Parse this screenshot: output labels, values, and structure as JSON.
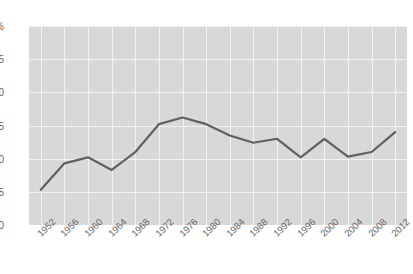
{
  "chart": {
    "title": ""
  },
  "axis": {
    "y_ticks": [
      "30%",
      "25",
      "20",
      "15",
      "10",
      "5",
      "0"
    ],
    "y_tick_values": [
      30,
      25,
      20,
      15,
      10,
      5,
      0
    ]
  },
  "chart_data": {
    "type": "line",
    "title": "",
    "xlabel": "",
    "ylabel": "",
    "ylim": [
      0,
      30
    ],
    "grid": true,
    "legend": "none",
    "y_tick_labels": [
      "0",
      "5",
      "10",
      "15",
      "20",
      "25",
      "30%"
    ],
    "y_ticks": [
      0,
      5,
      10,
      15,
      20,
      25,
      30
    ],
    "categories": [
      "1952",
      "1956",
      "1960",
      "1964",
      "1968",
      "1972",
      "1976",
      "1980",
      "1984",
      "1988",
      "1992",
      "1996",
      "2000",
      "2004",
      "2008",
      "2012"
    ],
    "values": [
      5.3,
      9.3,
      10.2,
      8.3,
      11.0,
      15.2,
      16.2,
      15.2,
      13.5,
      12.4,
      13.0,
      10.2,
      13.0,
      10.3,
      11.0,
      14.0
    ],
    "series": [
      {
        "name": "series-1",
        "color": "#606060",
        "values": [
          5.3,
          9.3,
          10.2,
          8.3,
          11.0,
          15.2,
          16.2,
          15.2,
          13.5,
          12.4,
          13.0,
          10.2,
          13.0,
          10.3,
          11.0,
          14.0
        ]
      }
    ]
  },
  "style": {
    "plot_background": "#d8d8d8",
    "gridline_color": "#f2f2f2",
    "line_color": "#606060",
    "tick_label_color": "#666666"
  }
}
